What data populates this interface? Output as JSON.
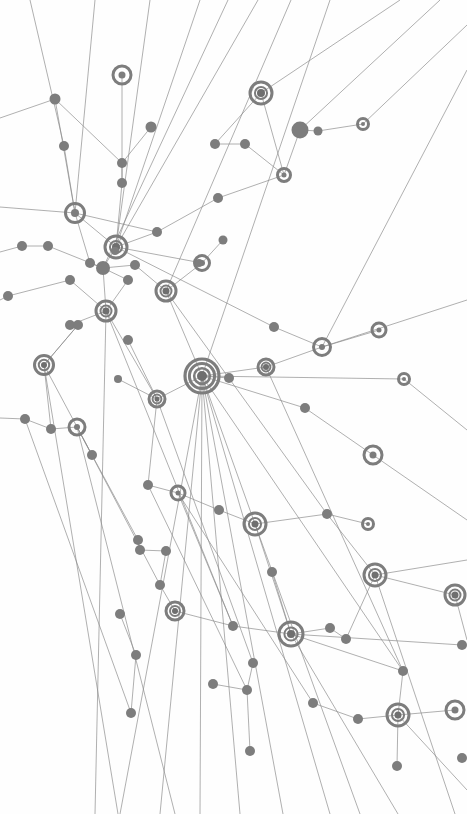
{
  "meta": {
    "width": 467,
    "height": 814,
    "background_color": "#fefefe"
  },
  "style": {
    "node_color": "#7d7d7d",
    "node_color_dark": "#6f6f6f",
    "edge_color": "#8a8a8a",
    "edge_width": 0.8,
    "edge_opacity": 0.85,
    "ring_stroke_width": 3
  },
  "legend": {
    "node_kinds": [
      {
        "kind": "dot",
        "description": "small filled circle node"
      },
      {
        "kind": "ring",
        "description": "hollow ring node"
      },
      {
        "kind": "target",
        "description": "concentric ring node with filled core"
      },
      {
        "kind": "hub",
        "description": "large multi-ring hub node"
      }
    ]
  },
  "chart_data": {
    "type": "scatter",
    "title": "",
    "xlabel": "",
    "ylabel": "",
    "xlim": [
      0,
      467
    ],
    "ylim": [
      0,
      814
    ],
    "grid": false,
    "legend_position": "none",
    "nodes": [
      {
        "id": "n1",
        "x": 55,
        "y": 99,
        "r": 5.5,
        "kind": "dot"
      },
      {
        "id": "n2",
        "x": 122,
        "y": 75,
        "r": 9,
        "kind": "ring",
        "inner": 3.5
      },
      {
        "id": "n3",
        "x": 151,
        "y": 127,
        "r": 5.5,
        "kind": "dot"
      },
      {
        "id": "n4",
        "x": 261,
        "y": 93,
        "r": 11,
        "kind": "target",
        "inner": 4
      },
      {
        "id": "n5",
        "x": 300,
        "y": 130,
        "r": 8.5,
        "kind": "dot"
      },
      {
        "id": "n6",
        "x": 318,
        "y": 131,
        "r": 4.5,
        "kind": "dot"
      },
      {
        "id": "n7",
        "x": 363,
        "y": 124,
        "r": 5.5,
        "kind": "ring",
        "inner": 2
      },
      {
        "id": "n8",
        "x": 215,
        "y": 144,
        "r": 5,
        "kind": "dot"
      },
      {
        "id": "n9",
        "x": 245,
        "y": 144,
        "r": 5,
        "kind": "dot"
      },
      {
        "id": "n10",
        "x": 64,
        "y": 146,
        "r": 5,
        "kind": "dot"
      },
      {
        "id": "n11",
        "x": 122,
        "y": 163,
        "r": 5,
        "kind": "dot"
      },
      {
        "id": "n12",
        "x": 284,
        "y": 175,
        "r": 6.5,
        "kind": "ring",
        "inner": 2.5
      },
      {
        "id": "n13",
        "x": 122,
        "y": 183,
        "r": 5,
        "kind": "dot"
      },
      {
        "id": "n14",
        "x": 218,
        "y": 198,
        "r": 5,
        "kind": "dot"
      },
      {
        "id": "n15",
        "x": 75,
        "y": 213,
        "r": 9.5,
        "kind": "ring",
        "inner": 4
      },
      {
        "id": "n16",
        "x": 157,
        "y": 232,
        "r": 5,
        "kind": "dot"
      },
      {
        "id": "n17",
        "x": 116,
        "y": 247,
        "r": 11,
        "kind": "target",
        "inner": 4
      },
      {
        "id": "n18",
        "x": 22,
        "y": 246,
        "r": 5,
        "kind": "dot"
      },
      {
        "id": "n19",
        "x": 48,
        "y": 246,
        "r": 5,
        "kind": "dot"
      },
      {
        "id": "n20",
        "x": 202,
        "y": 263,
        "r": 7.5,
        "kind": "ring",
        "inner": 3
      },
      {
        "id": "n21",
        "x": 223,
        "y": 240,
        "r": 4.5,
        "kind": "dot"
      },
      {
        "id": "n22",
        "x": 90,
        "y": 263,
        "r": 5,
        "kind": "dot"
      },
      {
        "id": "n23",
        "x": 103,
        "y": 268,
        "r": 7,
        "kind": "dot"
      },
      {
        "id": "n24",
        "x": 135,
        "y": 265,
        "r": 5,
        "kind": "dot"
      },
      {
        "id": "n25",
        "x": 166,
        "y": 291,
        "r": 10,
        "kind": "target",
        "inner": 3.5
      },
      {
        "id": "n26",
        "x": 128,
        "y": 280,
        "r": 5,
        "kind": "dot"
      },
      {
        "id": "n27",
        "x": 8,
        "y": 296,
        "r": 5,
        "kind": "dot"
      },
      {
        "id": "n28",
        "x": 70,
        "y": 280,
        "r": 5,
        "kind": "dot"
      },
      {
        "id": "n29",
        "x": 106,
        "y": 311,
        "r": 10,
        "kind": "target",
        "inner": 3.5
      },
      {
        "id": "n30",
        "x": 70,
        "y": 325,
        "r": 5,
        "kind": "dot"
      },
      {
        "id": "n31",
        "x": 78,
        "y": 325,
        "r": 5,
        "kind": "dot"
      },
      {
        "id": "n32",
        "x": 128,
        "y": 340,
        "r": 5,
        "kind": "dot"
      },
      {
        "id": "n33",
        "x": 274,
        "y": 327,
        "r": 5,
        "kind": "dot"
      },
      {
        "id": "n34",
        "x": 322,
        "y": 347,
        "r": 8.5,
        "kind": "ring",
        "inner": 3
      },
      {
        "id": "n35",
        "x": 379,
        "y": 330,
        "r": 7,
        "kind": "ring",
        "inner": 2.5
      },
      {
        "id": "n36",
        "x": 44,
        "y": 365,
        "r": 9.5,
        "kind": "target",
        "inner": 3
      },
      {
        "id": "n37",
        "x": 266,
        "y": 367,
        "r": 8,
        "kind": "target",
        "inner": 3
      },
      {
        "id": "n38",
        "x": 404,
        "y": 379,
        "r": 5.5,
        "kind": "ring",
        "inner": 2
      },
      {
        "id": "n39",
        "x": 202,
        "y": 376,
        "r": 17,
        "kind": "hub",
        "inner": 5
      },
      {
        "id": "n40",
        "x": 229,
        "y": 378,
        "r": 5,
        "kind": "dot"
      },
      {
        "id": "n41",
        "x": 157,
        "y": 399,
        "r": 8,
        "kind": "target",
        "inner": 2.5
      },
      {
        "id": "n42",
        "x": 118,
        "y": 379,
        "r": 4,
        "kind": "dot"
      },
      {
        "id": "n43",
        "x": 25,
        "y": 419,
        "r": 5,
        "kind": "dot"
      },
      {
        "id": "n44",
        "x": 51,
        "y": 429,
        "r": 5,
        "kind": "dot"
      },
      {
        "id": "n45",
        "x": 77,
        "y": 427,
        "r": 8,
        "kind": "ring",
        "inner": 3
      },
      {
        "id": "n46",
        "x": 305,
        "y": 408,
        "r": 5,
        "kind": "dot"
      },
      {
        "id": "n47",
        "x": 373,
        "y": 455,
        "r": 9,
        "kind": "ring",
        "inner": 3.5
      },
      {
        "id": "n48",
        "x": 92,
        "y": 455,
        "r": 5,
        "kind": "dot"
      },
      {
        "id": "n49",
        "x": 148,
        "y": 485,
        "r": 5,
        "kind": "dot"
      },
      {
        "id": "n50",
        "x": 178,
        "y": 493,
        "r": 7,
        "kind": "ring",
        "inner": 2.5
      },
      {
        "id": "n51",
        "x": 219,
        "y": 510,
        "r": 5,
        "kind": "dot"
      },
      {
        "id": "n52",
        "x": 255,
        "y": 524,
        "r": 11,
        "kind": "target",
        "inner": 3.5
      },
      {
        "id": "n53",
        "x": 327,
        "y": 514,
        "r": 5,
        "kind": "dot"
      },
      {
        "id": "n54",
        "x": 368,
        "y": 524,
        "r": 5.5,
        "kind": "ring",
        "inner": 2
      },
      {
        "id": "n55",
        "x": 138,
        "y": 540,
        "r": 5,
        "kind": "dot"
      },
      {
        "id": "n56",
        "x": 140,
        "y": 550,
        "r": 5,
        "kind": "dot"
      },
      {
        "id": "n57",
        "x": 166,
        "y": 551,
        "r": 5,
        "kind": "dot"
      },
      {
        "id": "n58",
        "x": 375,
        "y": 575,
        "r": 11,
        "kind": "target",
        "inner": 3.5
      },
      {
        "id": "n59",
        "x": 160,
        "y": 585,
        "r": 5,
        "kind": "dot"
      },
      {
        "id": "n60",
        "x": 272,
        "y": 572,
        "r": 5,
        "kind": "dot"
      },
      {
        "id": "n61",
        "x": 455,
        "y": 595,
        "r": 10,
        "kind": "target",
        "inner": 3.5
      },
      {
        "id": "n62",
        "x": 175,
        "y": 611,
        "r": 9,
        "kind": "target",
        "inner": 3
      },
      {
        "id": "n63",
        "x": 233,
        "y": 626,
        "r": 5,
        "kind": "dot"
      },
      {
        "id": "n64",
        "x": 291,
        "y": 634,
        "r": 12,
        "kind": "target",
        "inner": 4
      },
      {
        "id": "n65",
        "x": 120,
        "y": 614,
        "r": 5,
        "kind": "dot"
      },
      {
        "id": "n66",
        "x": 330,
        "y": 628,
        "r": 5,
        "kind": "dot"
      },
      {
        "id": "n67",
        "x": 346,
        "y": 639,
        "r": 5,
        "kind": "dot"
      },
      {
        "id": "n68",
        "x": 136,
        "y": 655,
        "r": 5,
        "kind": "dot"
      },
      {
        "id": "n69",
        "x": 253,
        "y": 663,
        "r": 5,
        "kind": "dot"
      },
      {
        "id": "n70",
        "x": 403,
        "y": 671,
        "r": 5,
        "kind": "dot"
      },
      {
        "id": "n71",
        "x": 213,
        "y": 684,
        "r": 5,
        "kind": "dot"
      },
      {
        "id": "n72",
        "x": 247,
        "y": 690,
        "r": 5,
        "kind": "dot"
      },
      {
        "id": "n73",
        "x": 131,
        "y": 713,
        "r": 5,
        "kind": "dot"
      },
      {
        "id": "n74",
        "x": 313,
        "y": 703,
        "r": 5,
        "kind": "dot"
      },
      {
        "id": "n75",
        "x": 358,
        "y": 719,
        "r": 5,
        "kind": "dot"
      },
      {
        "id": "n76",
        "x": 398,
        "y": 715,
        "r": 11,
        "kind": "target",
        "inner": 3.5
      },
      {
        "id": "n77",
        "x": 250,
        "y": 751,
        "r": 5,
        "kind": "dot"
      },
      {
        "id": "n78",
        "x": 397,
        "y": 766,
        "r": 5,
        "kind": "dot"
      },
      {
        "id": "n79",
        "x": 462,
        "y": 758,
        "r": 5,
        "kind": "dot"
      },
      {
        "id": "n80",
        "x": 455,
        "y": 710,
        "r": 9,
        "kind": "ring",
        "inner": 3.5
      },
      {
        "id": "n81",
        "x": 199,
        "y": 263,
        "r": 4,
        "kind": "dot"
      },
      {
        "id": "n82",
        "x": 115,
        "y": 251,
        "r": 4,
        "kind": "dot"
      },
      {
        "id": "n83",
        "x": 462,
        "y": 645,
        "r": 5,
        "kind": "dot"
      }
    ],
    "edges": [
      [
        "n1",
        "n15"
      ],
      [
        "n1",
        "n11"
      ],
      [
        "n2",
        "n13"
      ],
      [
        "n3",
        "n11"
      ],
      [
        "n4",
        "n8"
      ],
      [
        "n4",
        "n12"
      ],
      [
        "n5",
        "n6"
      ],
      [
        "n6",
        "n7"
      ],
      [
        "n5",
        "n12"
      ],
      [
        "n8",
        "n9"
      ],
      [
        "n9",
        "n12"
      ],
      [
        "n12",
        "n14"
      ],
      [
        "n14",
        "n16"
      ],
      [
        "n10",
        "n15"
      ],
      [
        "n11",
        "n13"
      ],
      [
        "n13",
        "n17"
      ],
      [
        "n15",
        "n17"
      ],
      [
        "n15",
        "n22"
      ],
      [
        "n16",
        "n17"
      ],
      [
        "n17",
        "n23"
      ],
      [
        "n18",
        "n19"
      ],
      [
        "n19",
        "n23"
      ],
      [
        "n20",
        "n21"
      ],
      [
        "n20",
        "n25"
      ],
      [
        "n22",
        "n23"
      ],
      [
        "n23",
        "n24"
      ],
      [
        "n24",
        "n25"
      ],
      [
        "n23",
        "n26"
      ],
      [
        "n26",
        "n29"
      ],
      [
        "n27",
        "n28"
      ],
      [
        "n28",
        "n29"
      ],
      [
        "n29",
        "n30"
      ],
      [
        "n30",
        "n31"
      ],
      [
        "n31",
        "n36"
      ],
      [
        "n32",
        "n41"
      ],
      [
        "n33",
        "n34"
      ],
      [
        "n34",
        "n35"
      ],
      [
        "n34",
        "n37"
      ],
      [
        "n36",
        "n44"
      ],
      [
        "n37",
        "n39"
      ],
      [
        "n38",
        "n39"
      ],
      [
        "n39",
        "n40"
      ],
      [
        "n39",
        "n41"
      ],
      [
        "n41",
        "n42"
      ],
      [
        "n43",
        "n44"
      ],
      [
        "n44",
        "n45"
      ],
      [
        "n45",
        "n48"
      ],
      [
        "n46",
        "n39"
      ],
      [
        "n46",
        "n47"
      ],
      [
        "n48",
        "n55"
      ],
      [
        "n49",
        "n50"
      ],
      [
        "n50",
        "n51"
      ],
      [
        "n51",
        "n52"
      ],
      [
        "n52",
        "n53"
      ],
      [
        "n53",
        "n54"
      ],
      [
        "n55",
        "n56"
      ],
      [
        "n56",
        "n57"
      ],
      [
        "n57",
        "n59"
      ],
      [
        "n58",
        "n53"
      ],
      [
        "n59",
        "n62"
      ],
      [
        "n60",
        "n64"
      ],
      [
        "n62",
        "n63"
      ],
      [
        "n63",
        "n64"
      ],
      [
        "n64",
        "n66"
      ],
      [
        "n66",
        "n67"
      ],
      [
        "n65",
        "n68"
      ],
      [
        "n68",
        "n73"
      ],
      [
        "n69",
        "n72"
      ],
      [
        "n70",
        "n76"
      ],
      [
        "n71",
        "n72"
      ],
      [
        "n74",
        "n75"
      ],
      [
        "n75",
        "n76"
      ],
      [
        "n76",
        "n78"
      ],
      [
        "n77",
        "n72"
      ],
      [
        "n61",
        "n58"
      ],
      [
        "n80",
        "n76"
      ],
      [
        "n23",
        "n29"
      ],
      [
        "n29",
        "n41"
      ],
      [
        "n39",
        "n52"
      ],
      [
        "n52",
        "n64"
      ],
      [
        "n25",
        "n39"
      ],
      [
        "n17",
        "n20"
      ],
      [
        "n36",
        "n31"
      ],
      [
        "n45",
        "n59"
      ],
      [
        "n41",
        "n49"
      ],
      [
        "n50",
        "n63"
      ],
      [
        "n64",
        "n70"
      ],
      [
        "n58",
        "n67"
      ]
    ]
  }
}
